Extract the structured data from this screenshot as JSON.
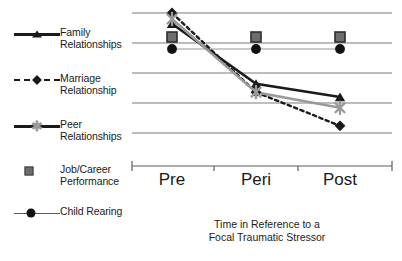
{
  "chart_data": {
    "type": "line",
    "title": "",
    "xlabel": "Time in Reference to a\nFocal Traumatic Stressor",
    "ylabel": "",
    "categories": [
      "Pre",
      "Peri",
      "Post"
    ],
    "grid": true,
    "gridlines": 5,
    "ylim": [
      0,
      5
    ],
    "legend_position": "left",
    "series": [
      {
        "name": "Family\nRelationships",
        "marker": "triangle",
        "line": "solid-thick",
        "color": "#1a1a1a",
        "values": [
          4.55,
          2.05,
          1.5
        ]
      },
      {
        "name": "Marriage\nRelationship",
        "marker": "diamond",
        "line": "dashed",
        "color": "#1a1a1a",
        "values": [
          5.0,
          1.7,
          0.3
        ]
      },
      {
        "name": "Peer\nRelationships",
        "marker": "cross",
        "line": "solid-thick",
        "color": "#9a9a9a",
        "values": [
          4.75,
          1.7,
          1.05
        ]
      },
      {
        "name": "Job/Career\nPerformance",
        "marker": "square",
        "line": "none",
        "color": "#6e6e6e",
        "values": [
          4.0,
          4.0,
          4.0
        ]
      },
      {
        "name": "Child Rearing",
        "marker": "circle",
        "line": "thin",
        "color": "#111111",
        "values": [
          3.5,
          3.5,
          3.5
        ]
      }
    ]
  },
  "legend": {
    "items": [
      {
        "label": "Family\nRelationships",
        "key": "triangle-line-key"
      },
      {
        "label": "Marriage\nRelationship",
        "key": "diamond-dashed-key"
      },
      {
        "label": "Peer\nRelationships",
        "key": "cross-line-key"
      },
      {
        "label": "Job/Career\nPerformance",
        "key": "square-key"
      },
      {
        "label": "Child Rearing",
        "key": "circle-line-key"
      }
    ]
  },
  "axis": {
    "ticks": [
      "Pre",
      "Peri",
      "Post"
    ],
    "caption": "Time in Reference to a\nFocal Traumatic Stressor"
  }
}
